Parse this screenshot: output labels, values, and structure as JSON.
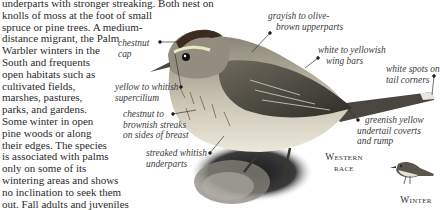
{
  "body_text": {
    "lines": [
      "underparts with stronger streaking. Both nest on",
      "knolls of moss at the foot of small",
      "spruce or pine trees. A medium-",
      "distance migrant, the Palm",
      "Warbler winters in the",
      "South and frequents",
      "open habitats such as",
      "cultivated fields,",
      "marshes, pastures,",
      "parks, and gardens.",
      "Some winter in open",
      "pine woods or along",
      "their edges. The species",
      "is associated with palms",
      "only on some of its",
      "wintering areas and shows",
      "no inclination to seek them",
      "out. Fall adults and juveniles"
    ]
  },
  "callouts": {
    "chestnut_cap": [
      "chestnut",
      "cap"
    ],
    "supercilium": [
      "yellow to whitish",
      "supercilium"
    ],
    "breast_streaks": [
      "chestnut to",
      "brownish streaks",
      "on sides of breast"
    ],
    "underparts": [
      "streaked whitish",
      "underparts"
    ],
    "upperparts": [
      "grayish to olive-",
      "brown upperparts"
    ],
    "wing_bars": [
      "white to yellowish",
      "wing bars"
    ],
    "tail_spots": [
      "white spots on",
      "tail corners"
    ],
    "undertail": [
      "greenish yellow",
      "undertail coverts",
      "and rump"
    ]
  },
  "race_labels": {
    "western": [
      "Western",
      "race"
    ],
    "winter": "Winter"
  },
  "colors": {
    "text": "#2b2b2b",
    "leader_line": "#333333"
  }
}
